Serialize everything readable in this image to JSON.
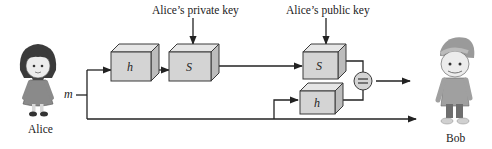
{
  "diagram": {
    "sender": {
      "name": "Alice",
      "message_label": "m"
    },
    "receiver": {
      "name": "Bob"
    },
    "keys": {
      "private_key_label": "Alice’s private key",
      "public_key_label": "Alice’s public key"
    },
    "blocks": {
      "sender_hash": "h",
      "sign": "S",
      "verify": "S",
      "receiver_hash": "h",
      "compare": "="
    },
    "colors": {
      "box_fill": "#d4d4d4",
      "box_top": "#e6e6e6",
      "box_side": "#bcbcbc",
      "line": "#222222",
      "alice_hair": "#3b3b3b",
      "alice_dress": "#8a8a8a",
      "bob_cap": "#9a9a9a",
      "bob_shirt": "#a0a0a0"
    }
  }
}
